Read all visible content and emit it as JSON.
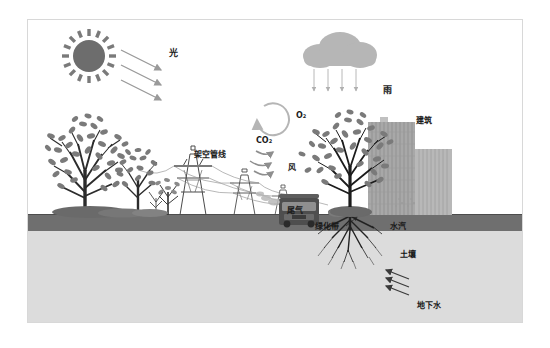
{
  "diagram": {
    "frame": {
      "x": 27,
      "y": 19,
      "width": 496,
      "height": 304,
      "border_color": "#d8d8d8"
    },
    "background_color": "#ffffff",
    "ground": {
      "topsoil_color": "#6e6e6e",
      "subsoil_color": "#d9d9d9",
      "surface_y": 214,
      "topsoil_height": 15
    },
    "labels": [
      {
        "id": "light",
        "text": "光",
        "x": 141,
        "y": 34,
        "size": 9
      },
      {
        "id": "rain",
        "text": "雨",
        "x": 355,
        "y": 71,
        "size": 9
      },
      {
        "id": "o2",
        "text": "O",
        "sub": "2",
        "x": 268,
        "y": 98,
        "size": 8
      },
      {
        "id": "co2",
        "text": "CO",
        "sub": "2",
        "x": 231,
        "y": 123,
        "size": 8
      },
      {
        "id": "building",
        "text": "建筑",
        "x": 388,
        "y": 103,
        "size": 8
      },
      {
        "id": "overhead-pipeline",
        "text": "架空管线",
        "x": 166,
        "y": 137,
        "size": 8
      },
      {
        "id": "wind",
        "text": "风",
        "x": 260,
        "y": 150,
        "size": 8
      },
      {
        "id": "exhaust",
        "text": "尾气",
        "x": 259,
        "y": 193,
        "size": 8
      },
      {
        "id": "green-belt",
        "text": "绿化带",
        "x": 307,
        "y": 210,
        "size": 8
      },
      {
        "id": "water-vapor",
        "text": "水汽",
        "x": 382,
        "y": 209,
        "size": 8
      },
      {
        "id": "soil",
        "text": "土壤",
        "x": 392,
        "y": 237,
        "size": 8
      },
      {
        "id": "groundwater",
        "text": "地下水",
        "x": 409,
        "y": 288,
        "size": 8
      }
    ],
    "elements": {
      "sun": {
        "name": "sun-icon",
        "cx": 88,
        "cy": 55,
        "r": 17,
        "rays": 16,
        "color": "#6d6d6d"
      },
      "cloud": {
        "name": "cloud-icon",
        "cx": 330,
        "cy": 55,
        "color": "#b4b4b4"
      },
      "light_arrows": {
        "count": 3,
        "color": "#9a9a9a"
      },
      "rain_arrows": {
        "count": 4,
        "color": "#b0b0b0"
      },
      "co2_o2_cycle": {
        "cx": 254,
        "cy": 112,
        "r": 16,
        "color": "#b5b5b5"
      },
      "wind_arrows": {
        "count": 3,
        "color": "#9a9a9a"
      },
      "groundwater_arrows": {
        "count": 3,
        "color": "#4a4a4a"
      },
      "trees_left": 4,
      "tree_right": 1,
      "transmission_towers": 4,
      "buildings": 2,
      "bus": {
        "name": "bus-icon",
        "x": 278,
        "y": 205,
        "color": "#4e4e4e"
      }
    }
  }
}
